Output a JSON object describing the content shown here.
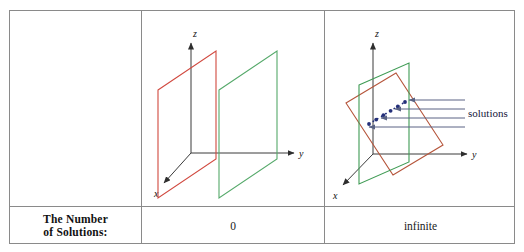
{
  "table": {
    "row_label": {
      "line1": "The Number",
      "line2": "of Solutions:"
    },
    "columns": [
      {
        "id": "parallel-planes",
        "solutions_count": "0"
      },
      {
        "id": "intersecting-planes",
        "solutions_count": "infinite"
      }
    ]
  },
  "diagram_parallel": {
    "axis_x": "x",
    "axis_y": "y",
    "axis_z": "z",
    "plane_colors": {
      "plane_a": "#d1493f",
      "plane_b": "#55a96a"
    },
    "description": "two parallel planes, no intersection"
  },
  "diagram_intersecting": {
    "axis_x": "x",
    "axis_y": "y",
    "axis_z": "z",
    "solutions_label": "solutions",
    "plane_colors": {
      "plane_a": "#b5543a",
      "plane_b": "#3f9b54"
    },
    "intersection_color": "#24307a",
    "arrow_color": "#5a6384",
    "arrow_count": 4,
    "description": "two planes intersecting in a line of solutions"
  },
  "palette": {
    "border": "#8a8a8a",
    "axis": "#3a3a3a",
    "text": "#111111",
    "background": "#ffffff"
  }
}
